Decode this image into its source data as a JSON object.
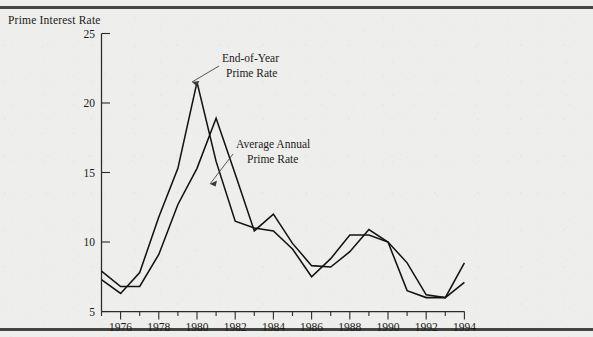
{
  "figure": {
    "y_axis_title": "Prime Interest Rate",
    "background_color": "#eeeeec",
    "ink_color": "#131313"
  },
  "annotations": [
    {
      "id": "eoy",
      "line1": "End-of-Year",
      "line2": "Prime Rate"
    },
    {
      "id": "avg",
      "line1": "Average Annual",
      "line2": "Prime Rate"
    }
  ],
  "chart_data": {
    "type": "line",
    "title": "",
    "xlabel": "",
    "ylabel": "Prime Interest Rate",
    "xlim": [
      1975,
      1994
    ],
    "ylim": [
      5,
      25
    ],
    "yticks": [
      5,
      10,
      15,
      20,
      25
    ],
    "ytick_labels": [
      "5",
      "10",
      "15",
      "20",
      "25"
    ],
    "xticks": [
      1976,
      1978,
      1980,
      1982,
      1984,
      1986,
      1988,
      1990,
      1992,
      1994
    ],
    "xtick_labels": [
      "1976",
      "1978",
      "1980",
      "1982",
      "1984",
      "1986",
      "1988",
      "1990",
      "1992",
      "1994"
    ],
    "minor_xticks": [
      1975,
      1977,
      1979,
      1981,
      1983,
      1985,
      1987,
      1989,
      1991,
      1993
    ],
    "grid": false,
    "legend": "annotated-inline",
    "x": [
      1975,
      1976,
      1977,
      1978,
      1979,
      1980,
      1981,
      1982,
      1983,
      1984,
      1985,
      1986,
      1987,
      1988,
      1989,
      1990,
      1991,
      1992,
      1993,
      1994
    ],
    "series": [
      {
        "name": "End-of-Year Prime Rate",
        "values": [
          7.3,
          6.3,
          7.8,
          11.8,
          15.3,
          21.5,
          15.8,
          11.5,
          11.0,
          10.8,
          9.5,
          7.5,
          8.8,
          10.5,
          10.5,
          10.0,
          6.5,
          6.0,
          6.0,
          8.5
        ]
      },
      {
        "name": "Average Annual Prime Rate",
        "values": [
          7.9,
          6.8,
          6.8,
          9.1,
          12.7,
          15.3,
          18.9,
          14.9,
          10.8,
          12.0,
          9.9,
          8.3,
          8.2,
          9.3,
          10.9,
          10.0,
          8.5,
          6.2,
          6.0,
          7.1
        ]
      }
    ]
  }
}
